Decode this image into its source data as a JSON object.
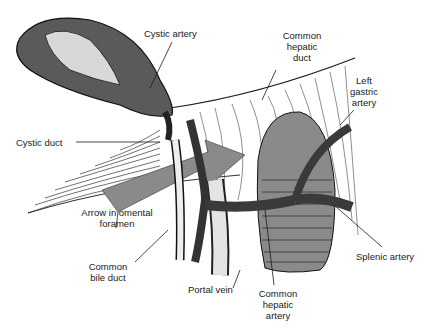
{
  "figure": {
    "colors": {
      "ink": "#1a1a1a",
      "fill_dark": "#3c3c3c",
      "fill_grey": "#8a8a8a",
      "background": "#ffffff"
    }
  },
  "labels": {
    "cystic_artery": "Cystic artery",
    "common_hepatic_duct": [
      "Common",
      "hepatic",
      "duct"
    ],
    "left_gastric_artery": [
      "Left",
      "gastric",
      "artery"
    ],
    "cystic_duct": "Cystic duct",
    "arrow_omental_foramen": [
      "Arrow in omental",
      "foramen"
    ],
    "common_bile_duct": [
      "Common",
      "bile duct"
    ],
    "portal_vein": "Portal vein",
    "common_hepatic_artery": [
      "Common",
      "hepatic",
      "artery"
    ],
    "splenic_artery": "Splenic artery"
  }
}
